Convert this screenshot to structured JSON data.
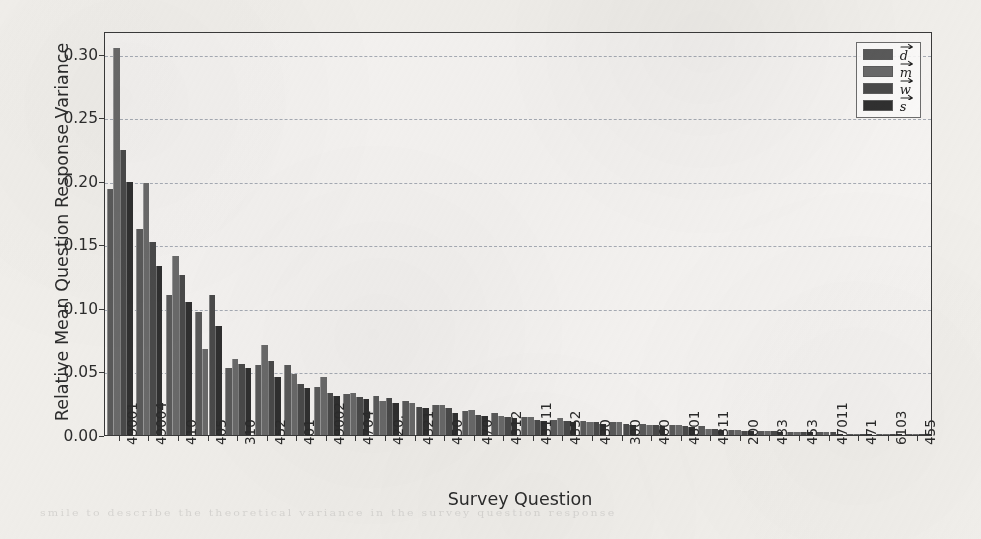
{
  "figure": {
    "title": "",
    "xlabel": "Survey Question",
    "ylabel": "Relative Mean Question Response Variance",
    "background_color": "#f2f0ec",
    "frame_color": "#3a3a3a",
    "gridline_color": "#9aa0ab",
    "ghost_text": "smile to describe the theoretical variance in the survey question response"
  },
  "yaxis": {
    "ticks": [
      "0.00",
      "0.05",
      "0.10",
      "0.15",
      "0.20",
      "0.25",
      "0.30"
    ],
    "tick_values": [
      0.0,
      0.05,
      0.1,
      0.15,
      0.2,
      0.25,
      0.3
    ],
    "min": 0.0,
    "max": 0.318
  },
  "legend": {
    "position": "upper-right",
    "entries": [
      {
        "label": "d",
        "vector": true,
        "color": "#5a5a5a"
      },
      {
        "label": "m",
        "vector": true,
        "color": "#6a6a6a"
      },
      {
        "label": "w",
        "vector": true,
        "color": "#4a4a4a"
      },
      {
        "label": "s",
        "vector": true,
        "color": "#303030"
      }
    ]
  },
  "chart_data": {
    "type": "bar",
    "title": "",
    "xlabel": "Survey Question",
    "ylabel": "Relative Mean Question Response Variance",
    "ylim": [
      0.0,
      0.318
    ],
    "grid": true,
    "legend_position": "upper right",
    "grouped": true,
    "categories": [
      "49001",
      "49004",
      "410",
      "405",
      "310",
      "452",
      "401",
      "49002",
      "4704",
      "420.",
      "4321",
      "450",
      "470",
      "4312",
      "43111",
      "4352",
      "430",
      "300",
      "460",
      "4801",
      "4311",
      "200",
      "433",
      "453",
      "47011",
      "471",
      "6103",
      "455"
    ],
    "series": [
      {
        "name": "d",
        "color": "#5a5a5a",
        "values": [
          0.194,
          0.162,
          0.11,
          0.097,
          0.053,
          0.055,
          0.055,
          0.038,
          0.032,
          0.031,
          0.027,
          0.024,
          0.019,
          0.017,
          0.014,
          0.012,
          0.011,
          0.01,
          0.009,
          0.008,
          0.007,
          0.004,
          0.003,
          0.002,
          0.002,
          0.001,
          0.001,
          0.001
        ]
      },
      {
        "name": "m",
        "color": "#6a6a6a",
        "values": [
          0.305,
          0.198,
          0.141,
          0.068,
          0.06,
          0.071,
          0.048,
          0.046,
          0.033,
          0.027,
          0.025,
          0.024,
          0.02,
          0.015,
          0.014,
          0.013,
          0.01,
          0.01,
          0.008,
          0.008,
          0.005,
          0.004,
          0.003,
          0.002,
          0.002,
          0.001,
          0.001,
          0.001
        ]
      },
      {
        "name": "w",
        "color": "#4a4a4a",
        "values": [
          0.224,
          0.152,
          0.126,
          0.11,
          0.056,
          0.058,
          0.04,
          0.033,
          0.03,
          0.029,
          0.022,
          0.021,
          0.016,
          0.014,
          0.012,
          0.011,
          0.01,
          0.009,
          0.008,
          0.007,
          0.005,
          0.003,
          0.003,
          0.002,
          0.002,
          0.001,
          0.001,
          0.001
        ]
      },
      {
        "name": "s",
        "color": "#303030",
        "values": [
          0.199,
          0.133,
          0.105,
          0.086,
          0.053,
          0.046,
          0.037,
          0.031,
          0.028,
          0.025,
          0.021,
          0.017,
          0.015,
          0.013,
          0.011,
          0.01,
          0.009,
          0.008,
          0.007,
          0.006,
          0.004,
          0.003,
          0.002,
          0.002,
          0.001,
          0.001,
          0.001,
          0.001
        ]
      }
    ]
  }
}
